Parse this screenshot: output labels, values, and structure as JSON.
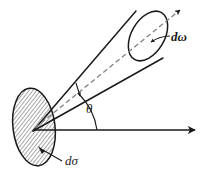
{
  "figure": {
    "kind": "scattering-cross-section-diagram",
    "background_color": "#ffffff",
    "ink_color": "#1a1a1a",
    "hatch_color": "#555555",
    "dash_color": "#777777",
    "width": 207,
    "height": 181,
    "labels": {
      "solid_angle": "dω",
      "cross_section": "dσ",
      "scattering_angle": "θ"
    },
    "elements": {
      "target_area_name": "hatched-ellipse",
      "cone_name": "solid-angle-cone",
      "cap_name": "cone-cap-ellipse",
      "axis_name": "cone-axis-dashed-arrow",
      "reference_name": "horizontal-reference-arrow",
      "arc_name": "theta-angle-arc",
      "leader_domega_name": "domega-leader-arrow",
      "leader_dsigma_name": "dsigma-leader-line"
    },
    "geometry": {
      "apex": [
        33,
        131
      ],
      "ellipse_center": [
        34,
        127
      ],
      "ellipse_rx": 21,
      "ellipse_ry": 39,
      "ellipse_rotation_deg": -7,
      "cap_center": [
        148,
        36
      ],
      "cap_rx": 17,
      "cap_ry": 27,
      "cap_rotation_deg": 28,
      "axis_tip": [
        183,
        8
      ],
      "horizontal_tip": [
        197,
        130
      ],
      "horizontal_y": 130,
      "arc_radius": 64
    }
  }
}
